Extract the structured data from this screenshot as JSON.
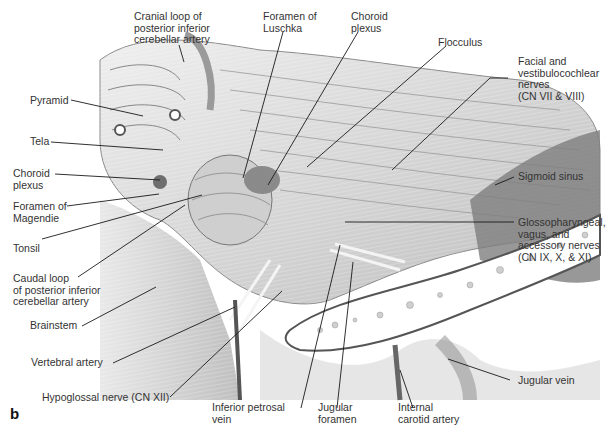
{
  "figure": {
    "panel_letter": "b",
    "labels": {
      "cranial_loop": "Cranial loop of\nposterior inferior\ncerebellar artery",
      "foramen_luschka": "Foramen of\nLuschka",
      "choroid_plexus_top": "Choroid\nplexus",
      "flocculus": "Flocculus",
      "facial_vestibulocochlear": "Facial and\nvestibulocochlear\nnerves\n(CN VII & VIII)",
      "pyramid": "Pyramid",
      "tela": "Tela",
      "choroid_plexus_left": "Choroid\nplexus",
      "foramen_magendie": "Foramen of\nMagendie",
      "tonsil": "Tonsil",
      "caudal_loop": "Caudal loop\nof posterior inferior\ncerebellar artery",
      "sigmoid_sinus": "Sigmoid sinus",
      "glossopharyngeal": "Glossopharyngeal,\nvagus, and\naccessory nerves\n(CN IX, X, & XI)",
      "brainstem": "Brainstem",
      "vertebral_artery": "Vertebral artery",
      "hypoglossal": "Hypoglossal nerve (CN XII)",
      "inferior_petrosal": "Inferior petrosal\nvein",
      "jugular_foramen": "Jugular\nforamen",
      "internal_carotid": "Internal\ncarotid artery",
      "jugular_vein": "Jugular vein"
    },
    "colors": {
      "background": "#ffffff",
      "illustration_light": "#e6e6e6",
      "illustration_mid": "#b8b8b8",
      "illustration_dark": "#6e6e6e",
      "leader_line": "#1a1a1a"
    }
  }
}
